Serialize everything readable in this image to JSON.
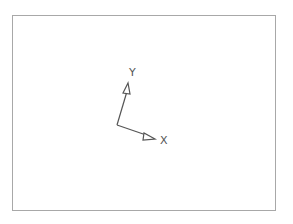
{
  "viewport": {
    "frame_color": "#a8a8a8",
    "background": "#ffffff"
  },
  "axes_gizmo": {
    "line_color": "#555555",
    "origin": [
      117,
      125
    ],
    "x_axis": {
      "label": "X",
      "tip": [
        154,
        138
      ]
    },
    "y_axis": {
      "label": "Y",
      "tip": [
        128,
        84
      ]
    }
  }
}
